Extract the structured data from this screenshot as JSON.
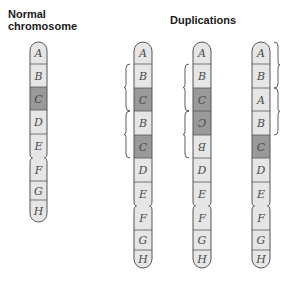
{
  "titles": {
    "normal_line1": "Normal",
    "normal_line2": "chromosome",
    "duplications": "Duplications"
  },
  "colors": {
    "segment_light": "#e6e6e6",
    "segment_dark": "#9a9a9a",
    "outline": "#555555",
    "label": "#4a4a4a"
  },
  "chromosomes": [
    {
      "name": "normal",
      "segments": [
        "A",
        "B",
        "C",
        "D",
        "E",
        "F",
        "G",
        "H"
      ]
    },
    {
      "name": "tandem-duplication",
      "segments": [
        "A",
        "B",
        "C",
        "B",
        "C",
        "D",
        "E",
        "F",
        "G",
        "H"
      ],
      "duplicated_region": "BC",
      "brace_side": "left"
    },
    {
      "name": "reverse-tandem-duplication",
      "segments": [
        "A",
        "B",
        "C",
        "C (inverted)",
        "B (inverted)",
        "D",
        "E",
        "F",
        "G",
        "H"
      ],
      "duplicated_region": "BC",
      "brace_side": "left"
    },
    {
      "name": "terminal-tandem-duplication",
      "segments": [
        "A",
        "B",
        "A",
        "B",
        "C",
        "D",
        "E",
        "F",
        "G",
        "H"
      ],
      "duplicated_region": "AB",
      "brace_side": "right"
    }
  ]
}
